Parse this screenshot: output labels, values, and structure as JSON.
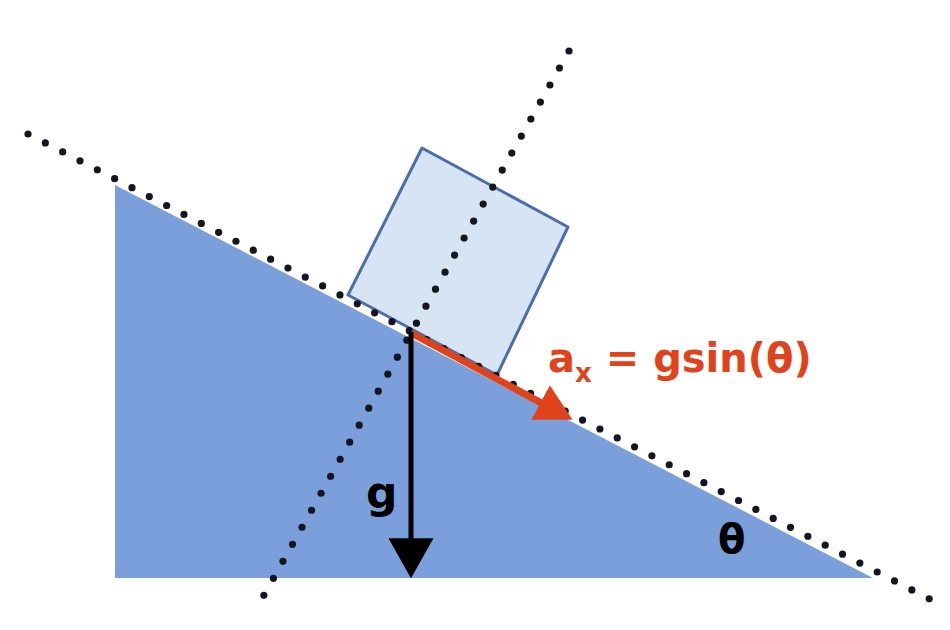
{
  "figure": {
    "background_color": "#ffffff",
    "width": 950,
    "height": 630
  },
  "colors": {
    "incline_fill": "#7B9FDB",
    "block_fill": "#D6E4F3",
    "block_stroke": "#4A6EA9",
    "dotted_line": "#14161F",
    "gravity_arrow": "#000000",
    "acceleration_arrow": "#E0431C",
    "acceleration_label": "#E0431C",
    "gravity_label": "#000000",
    "angle_label": "#000000"
  },
  "labels": {
    "acceleration": {
      "text": "a_x = gsin(θ)",
      "base": "a",
      "subscript": "x",
      "rest": " = gsin(θ)",
      "color": "#E0431C",
      "font_size": 40,
      "x": 548,
      "y": 372
    },
    "gravity": {
      "text": "g",
      "color": "#000000",
      "font_size": 44,
      "x": 366,
      "y": 508
    },
    "angle": {
      "text": "θ",
      "color": "#000000",
      "font_size": 40,
      "x": 718,
      "y": 553
    }
  },
  "shapes": {
    "incline_triangle": {
      "name": "inclined-plane",
      "points": "115,185 115,578 873,578",
      "fill": "#7B9FDB",
      "description": "Right triangle wedge, hypotenuse descends left-to-right"
    },
    "block": {
      "name": "sliding-block",
      "points": "422,148 568,227 497,375 348,295",
      "fill": "#D6E4F3",
      "stroke": "#4A6EA9",
      "stroke_width": 3,
      "description": "Rectangular block resting on the incline surface"
    },
    "incline_dotted_line": {
      "name": "incline-extension-line",
      "x1": 28,
      "y1": 134,
      "x2": 945,
      "y2": 607,
      "style": "dotted",
      "dot_radius": 3.6,
      "color": "#14161F"
    },
    "normal_dotted_line": {
      "name": "normal-extension-line",
      "x1": 569,
      "y1": 51,
      "x2": 259,
      "y2": 604,
      "style": "dotted",
      "dot_radius": 3.6,
      "color": "#14161F"
    }
  },
  "vectors": {
    "gravity": {
      "name": "gravity-vector",
      "symbol": "g",
      "x1": 411,
      "y1": 332,
      "x2": 411,
      "y2": 563,
      "color": "#000000",
      "line_width": 5,
      "head_length": 34,
      "head_width": 22,
      "direction": "down"
    },
    "acceleration": {
      "name": "acceleration-vector",
      "symbol": "a_x",
      "x1": 411,
      "y1": 333,
      "x2": 560,
      "y2": 413,
      "color": "#E0431C",
      "line_width": 7,
      "head_length": 30,
      "head_width": 24,
      "direction": "down-right along incline"
    }
  },
  "chart_data": {
    "type": "diagram",
    "annotations": [
      "a_x = gsin(θ)",
      "g",
      "θ"
    ],
    "elements": [
      "inclined plane wedge",
      "sliding block",
      "gravity vector (downward)",
      "acceleration vector (along incline)",
      "incline extension dotted line",
      "normal extension dotted line",
      "incline angle theta"
    ]
  }
}
